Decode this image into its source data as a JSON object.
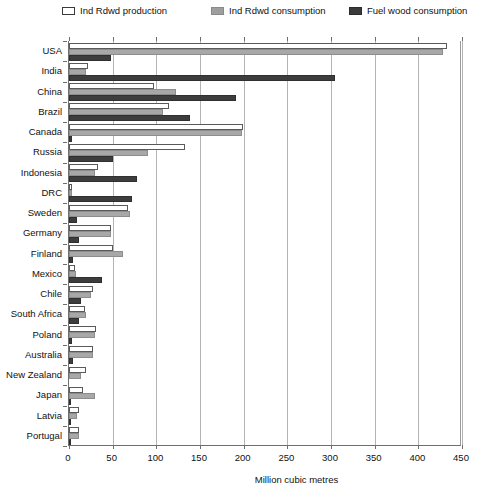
{
  "chart_data": {
    "type": "bar",
    "orientation": "horizontal",
    "title": "",
    "xlabel": "Million cubic metres",
    "ylabel": "",
    "xlim": [
      0,
      450
    ],
    "xticks": [
      0,
      50,
      100,
      150,
      200,
      250,
      300,
      350,
      400,
      450
    ],
    "grid": true,
    "legend_position": "top",
    "categories": [
      "USA",
      "India",
      "China",
      "Brazil",
      "Canada",
      "Russia",
      "Indonesia",
      "DRC",
      "Sweden",
      "Germany",
      "Finland",
      "Mexico",
      "Chile",
      "South Africa",
      "Poland",
      "Australia",
      "New Zealand",
      "Japan",
      "Latvia",
      "Portugal"
    ],
    "series": [
      {
        "name": "Ind Rdwd production",
        "color": "#ffffff",
        "values": [
          433,
          22,
          97,
          115,
          199,
          133,
          33,
          4,
          67,
          48,
          50,
          7,
          27,
          18,
          31,
          28,
          19,
          16,
          12,
          11
        ]
      },
      {
        "name": "Ind Rdwd consumption",
        "color": "#a8a8a8",
        "values": [
          428,
          20,
          122,
          108,
          198,
          90,
          30,
          4,
          70,
          48,
          62,
          8,
          25,
          20,
          30,
          27,
          14,
          30,
          9,
          11
        ]
      },
      {
        "name": "Fuel wood consumption",
        "color": "#3d3d3d",
        "values": [
          48,
          305,
          191,
          138,
          3,
          50,
          78,
          72,
          9,
          12,
          5,
          38,
          14,
          12,
          4,
          5,
          0,
          1,
          2,
          1
        ]
      }
    ]
  },
  "legend": {
    "items": [
      {
        "label": "Ind Rdwd production",
        "swatch": "legend-swatch-production"
      },
      {
        "label": "Ind Rdwd consumption",
        "swatch": "legend-swatch-consumption"
      },
      {
        "label": "Fuel wood consumption",
        "swatch": "legend-swatch-fuelwood"
      }
    ]
  },
  "axis": {
    "x_title": "Million cubic metres"
  }
}
